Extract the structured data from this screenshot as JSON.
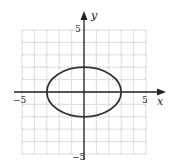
{
  "chart_data": {
    "type": "line",
    "title": "",
    "xlabel": "x",
    "ylabel": "y",
    "xlim": [
      -5,
      5
    ],
    "ylim": [
      -5,
      5
    ],
    "grid": true,
    "grid_step": 1,
    "tick_labels": {
      "x_min": "−5",
      "x_max": "5",
      "y_max": "5",
      "y_min": "−5"
    },
    "series": [
      {
        "name": "ellipse",
        "shape": "ellipse",
        "center": [
          0,
          0
        ],
        "semi_axis_x": 3,
        "semi_axis_y": 2,
        "equation": "x^2/9 + y^2/4 = 1"
      }
    ],
    "colors": {
      "grid": "#b8b8b8",
      "axis": "#222222",
      "curve": "#333333"
    }
  }
}
